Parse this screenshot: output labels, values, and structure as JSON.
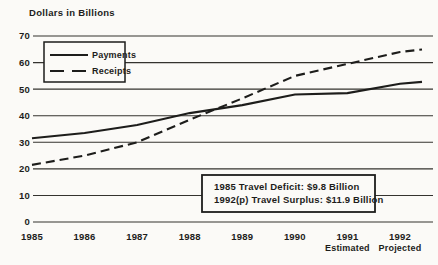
{
  "title": "Dollars in Billions",
  "colors": {
    "ink": "#1d1d1b",
    "grid": "#34332f",
    "paper": "#fbfaf7"
  },
  "chart_data": {
    "type": "line",
    "title": "Dollars in Billions",
    "ylabel": "Dollars in Billions",
    "xlabel": "",
    "ylim": [
      0,
      70
    ],
    "yticks": [
      0,
      10,
      20,
      30,
      40,
      50,
      60,
      70
    ],
    "grid": true,
    "legend_position": "top-left",
    "x_labels": [
      {
        "label": "1985",
        "sub": ""
      },
      {
        "label": "1986",
        "sub": ""
      },
      {
        "label": "1987",
        "sub": ""
      },
      {
        "label": "1988",
        "sub": ""
      },
      {
        "label": "1989",
        "sub": ""
      },
      {
        "label": "1990",
        "sub": ""
      },
      {
        "label": "1991",
        "sub": "Estimated"
      },
      {
        "label": "1992",
        "sub": "Projected"
      }
    ],
    "series": [
      {
        "name": "Payments",
        "style": "solid",
        "values": [
          31.5,
          33.5,
          36.5,
          41,
          44,
          48,
          48.5,
          52
        ]
      },
      {
        "name": "Receipts",
        "style": "dashed",
        "values": [
          21.5,
          25,
          30,
          38.5,
          46.5,
          55,
          59.5,
          64
        ]
      }
    ],
    "annotation": {
      "lines": [
        "1985 Travel Deficit: $9.8 Billion",
        "1992(p) Travel Surplus: $11.9 Billion"
      ]
    }
  }
}
